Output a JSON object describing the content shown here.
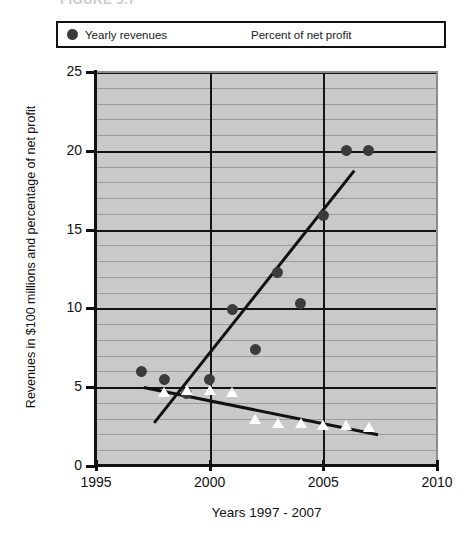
{
  "figure": {
    "title_fragment": "FIGURE 5.7  ",
    "x_axis_label": "Years 1997 - 2007",
    "y_axis_label": "Revenues in $100 millions and percentage of net profit"
  },
  "legend": {
    "items": [
      {
        "label": "Yearly revenues",
        "marker": "filled-pentagon-marker",
        "color": "#3b3b3b"
      },
      {
        "label": "Percent of net profit",
        "marker": "white-triangle-marker",
        "color": "#ffffff"
      }
    ]
  },
  "axes": {
    "y_ticks": [
      "0",
      "5",
      "10",
      "15",
      "20",
      "25"
    ],
    "x_ticks": [
      "1995",
      "2000",
      "2005",
      "2010"
    ]
  },
  "chart_data": {
    "type": "scatter",
    "title": "FIGURE 5.7",
    "xlabel": "Years 1997 - 2007",
    "ylabel": "Revenues in $100 millions and percentage of net profit",
    "xlim": [
      1995,
      2010
    ],
    "ylim": [
      0,
      25
    ],
    "x_ticks": [
      1995,
      2000,
      2005,
      2010
    ],
    "y_ticks": [
      0,
      5,
      10,
      15,
      20,
      25
    ],
    "grid": true,
    "grid_minor_step": 1,
    "grid_major_step": 5,
    "legend_position": "top",
    "plot_background": "#c9c9c9",
    "series": [
      {
        "name": "Yearly revenues",
        "marker": "filled-pentagon",
        "color": "#3b3b3b",
        "x": [
          1997,
          1998,
          1999,
          2000,
          2001,
          2002,
          2003,
          2004,
          2005,
          2006,
          2007
        ],
        "values": [
          6.0,
          5.5,
          4.6,
          5.5,
          9.9,
          7.4,
          12.3,
          10.3,
          15.9,
          20.0,
          20.0
        ]
      },
      {
        "name": "Percent of net profit",
        "marker": "white-triangle",
        "color": "#ffffff",
        "x": [
          1998,
          1999,
          2000,
          2001,
          2002,
          2003,
          2004,
          2005,
          2006,
          2007
        ],
        "values": [
          4.7,
          4.8,
          4.8,
          4.7,
          3.0,
          2.7,
          2.7,
          2.6,
          2.6,
          2.5
        ]
      }
    ],
    "trendlines": [
      {
        "name": "revenues-trendline",
        "color": "#111111",
        "x": [
          1997.5,
          2006.3
        ],
        "y": [
          2.8,
          18.8
        ]
      },
      {
        "name": "percent-trendline",
        "color": "#111111",
        "x": [
          1997.1,
          2007.4
        ],
        "y": [
          5.1,
          2.1
        ]
      }
    ]
  }
}
